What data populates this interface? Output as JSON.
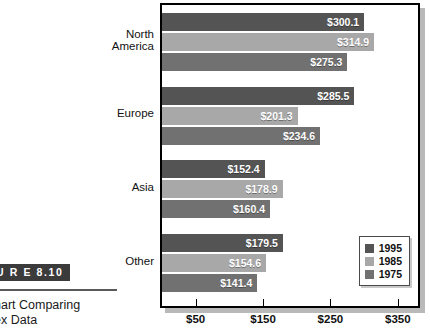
{
  "figure": {
    "badge": "U R E  8.10",
    "caption_line1": "hart Comparing",
    "caption_line2": "ex Data"
  },
  "chart_data": {
    "type": "bar",
    "orientation": "horizontal",
    "title": "",
    "xlabel": "",
    "ylabel": "",
    "categories": [
      "North\nAmerica",
      "Europe",
      "Asia",
      "Other"
    ],
    "series": [
      {
        "name": "1995",
        "color": "#545454",
        "values": [
          300.1,
          285.5,
          152.4,
          179.5
        ],
        "labels": [
          "$300.1",
          "$285.5",
          "$152.4",
          "$179.5"
        ]
      },
      {
        "name": "1985",
        "color": "#a8a8a8",
        "values": [
          314.9,
          201.3,
          178.9,
          154.6
        ],
        "labels": [
          "$314.9",
          "$201.3",
          "$178.9",
          "$154.6"
        ]
      },
      {
        "name": "1975",
        "color": "#717171",
        "values": [
          275.3,
          234.6,
          160.4,
          141.4
        ],
        "labels": [
          "$275.3",
          "$234.6",
          "$160.4",
          "$141.4"
        ]
      }
    ],
    "xlim": [
      0,
      380
    ],
    "xticks": [
      50,
      150,
      250,
      350
    ],
    "xticklabels": [
      "$50",
      "$150",
      "$250",
      "$350"
    ],
    "grid": false,
    "legend_position": "bottom-right",
    "legend_entries": [
      "1995",
      "1985",
      "1975"
    ]
  }
}
